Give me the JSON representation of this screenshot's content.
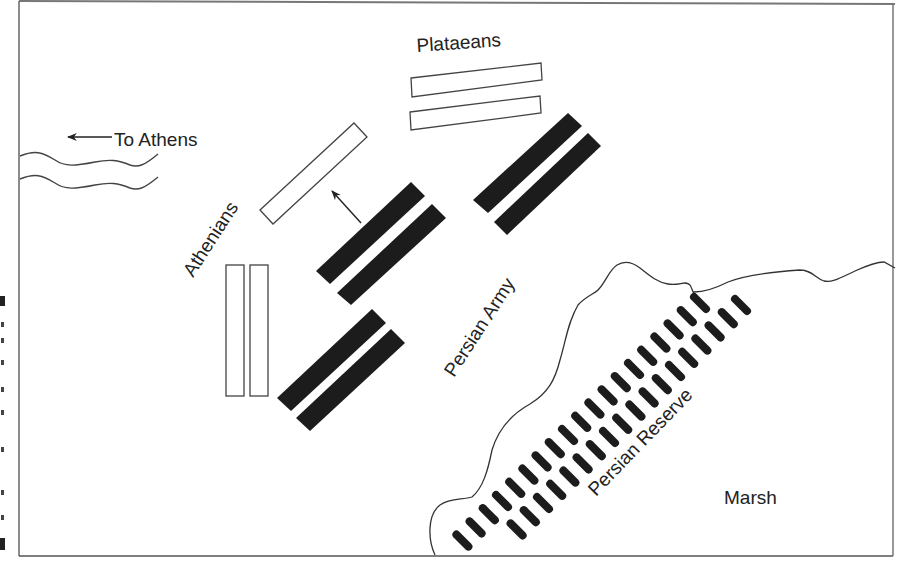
{
  "diagram": {
    "labels": {
      "to_athens": "To Athens",
      "plataeans": "Plataeans",
      "athenians": "Athenians",
      "persian_army": "Persian Army",
      "persian_reserve": "Persian Reserve",
      "marsh": "Marsh"
    },
    "colors": {
      "ink": "#222222",
      "persian_fill": "#1c1c1c",
      "greek_fill": "#ffffff",
      "frame": "#555555"
    },
    "units": {
      "greek": [
        {
          "name": "plataeans-upper",
          "shape": "outline-rect"
        },
        {
          "name": "plataeans-lower",
          "shape": "outline-rect"
        },
        {
          "name": "athenians-advance",
          "shape": "outline-rect"
        },
        {
          "name": "athenians-left",
          "shape": "outline-rect"
        },
        {
          "name": "athenians-right",
          "shape": "outline-rect"
        }
      ],
      "persian": [
        {
          "name": "persian-block-ne-1",
          "shape": "filled-rect"
        },
        {
          "name": "persian-block-ne-2",
          "shape": "filled-rect"
        },
        {
          "name": "persian-block-center-1",
          "shape": "filled-rect"
        },
        {
          "name": "persian-block-center-2",
          "shape": "filled-rect"
        },
        {
          "name": "persian-block-sw-1",
          "shape": "filled-rect"
        },
        {
          "name": "persian-block-sw-2",
          "shape": "filled-rect"
        }
      ],
      "reserve_rows": [
        {
          "name": "reserve-row-upper",
          "count": 19
        },
        {
          "name": "reserve-row-lower",
          "count": 18
        }
      ]
    },
    "arrows": [
      {
        "name": "to-athens-arrow",
        "direction": "west"
      },
      {
        "name": "advance-arrow",
        "direction": "northwest"
      }
    ]
  }
}
